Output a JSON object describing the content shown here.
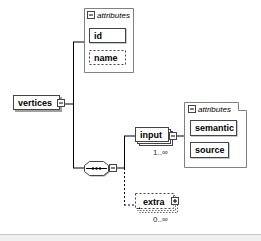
{
  "diagram": {
    "root": {
      "label": "vertices"
    },
    "root_attributes": {
      "header": "attributes",
      "items": [
        {
          "label": "id",
          "optional": false
        },
        {
          "label": "name",
          "optional": true
        }
      ]
    },
    "sequence": {
      "symbol": "•••"
    },
    "children": [
      {
        "label": "input",
        "cardinality": "1..∞",
        "optional": false
      },
      {
        "label": "extra",
        "cardinality": "0..∞",
        "optional": true
      }
    ],
    "input_attributes": {
      "header": "attributes",
      "items": [
        {
          "label": "semantic",
          "optional": false
        },
        {
          "label": "source",
          "optional": false
        }
      ]
    }
  },
  "colors": {
    "line": "#000000",
    "box_border": "#444444",
    "shadow": "#a0a0a0",
    "group_border": "#808080"
  }
}
